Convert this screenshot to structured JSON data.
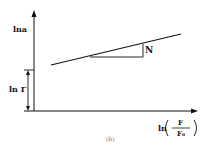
{
  "figure": {
    "caption": "(b)",
    "y_axis_label": "lna",
    "intercept_label": "ln Γ",
    "slope_label": "N",
    "x_axis_label": {
      "prefix": "ln",
      "numerator": "F",
      "denominator": "F₀"
    },
    "colors": {
      "line": "#111111",
      "background": "#ffffff"
    }
  }
}
